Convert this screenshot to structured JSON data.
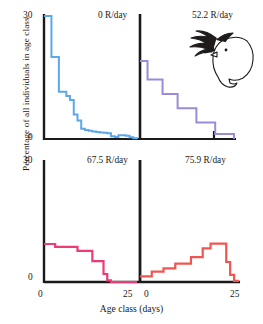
{
  "chart_data": {
    "type": "line",
    "title": "",
    "xlabel": "Age class (days)",
    "ylabel": "Percentage of all individuals in age class",
    "xlim": [
      0,
      25
    ],
    "ylim": [
      0,
      30
    ],
    "grid": false,
    "legend_position": "none",
    "annotation": "hand-drawn bird doodle",
    "panel_layout": "2x2",
    "panels": [
      {
        "id": "panel-top-left",
        "label": "0 R/day",
        "color": "#5CA8E8",
        "position": "top-left",
        "x": [
          0,
          1,
          2,
          3,
          4,
          5,
          6,
          7,
          8,
          9,
          10,
          11,
          12,
          13,
          14,
          15,
          16,
          17,
          18,
          19,
          20,
          21,
          22,
          23,
          24,
          25
        ],
        "y": [
          30,
          30,
          20,
          20,
          11.5,
          11.5,
          10.5,
          9.5,
          6,
          4.5,
          2.5,
          2.2,
          2.0,
          1.8,
          1.7,
          1.6,
          1.5,
          1.4,
          0.7,
          0.5,
          0.9,
          0.9,
          0.8,
          0.4,
          0.2,
          0
        ]
      },
      {
        "id": "panel-top-right",
        "label": "52.2 R/day",
        "color": "#9B8BD8",
        "position": "top-right",
        "x": [
          0,
          1,
          2,
          3,
          4,
          5,
          6,
          7,
          8,
          9,
          10,
          11,
          12,
          13,
          14,
          15,
          16,
          17,
          18,
          19,
          20,
          21,
          22,
          23,
          24,
          25
        ],
        "y": [
          19,
          19,
          14.5,
          14.5,
          14.5,
          14.5,
          11,
          11,
          11,
          11,
          7.5,
          7.5,
          7.5,
          7.5,
          7.5,
          4,
          4,
          4,
          4,
          4,
          1.2,
          1.2,
          1.2,
          1.2,
          1.2,
          0
        ]
      },
      {
        "id": "panel-bottom-left",
        "label": "67.5 R/day",
        "color": "#ED3A78",
        "position": "bottom-left",
        "x": [
          0,
          1,
          2,
          3,
          4,
          5,
          6,
          7,
          8,
          9,
          10,
          11,
          12,
          13,
          14,
          15,
          16,
          17,
          18,
          19,
          20,
          21,
          22,
          23,
          24,
          25
        ],
        "y": [
          9.5,
          9.5,
          9.5,
          8.8,
          8.8,
          8.8,
          8.8,
          8.8,
          8.8,
          7.8,
          7.8,
          7.8,
          7.8,
          5.2,
          5.2,
          5.2,
          2.0,
          0.4,
          0,
          0,
          0,
          0,
          0,
          0,
          0,
          0
        ]
      },
      {
        "id": "panel-bottom-right",
        "label": "75.9 R/day",
        "color": "#F0564F",
        "position": "bottom-right",
        "x": [
          0,
          1,
          2,
          3,
          4,
          5,
          6,
          7,
          8,
          9,
          10,
          11,
          12,
          13,
          14,
          15,
          16,
          17,
          18,
          19,
          20,
          21,
          22,
          23,
          24,
          25
        ],
        "y": [
          1.4,
          1.4,
          1.4,
          2.6,
          2.6,
          2.6,
          3.4,
          3.4,
          3.4,
          4.6,
          4.6,
          4.6,
          4.6,
          6.2,
          6.2,
          6.2,
          8.4,
          8.4,
          9.6,
          9.6,
          9.6,
          9.6,
          5.0,
          1.8,
          0.3,
          0
        ]
      }
    ],
    "y_ticks_top": [
      "30",
      "0"
    ],
    "y_ticks_bottom": [
      "30",
      "0"
    ],
    "x_ticks_left": [
      "0",
      "25"
    ],
    "x_ticks_right": [
      "0",
      "25"
    ]
  }
}
